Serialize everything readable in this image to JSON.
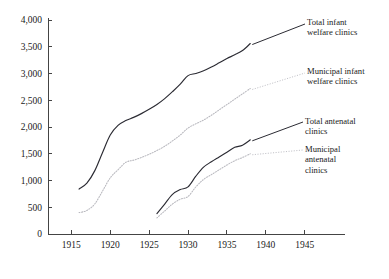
{
  "chart_data": {
    "type": "line",
    "title": "",
    "xlabel": "",
    "ylabel": "",
    "xlim": [
      1912,
      1948
    ],
    "ylim": [
      0,
      4000
    ],
    "grid": false,
    "legend_position": "right-annotations",
    "x_ticks": [
      "1915",
      "1920",
      "1925",
      "1930",
      "1935",
      "1940",
      "1945"
    ],
    "x_tick_values": [
      1915,
      1920,
      1925,
      1930,
      1935,
      1940,
      1945
    ],
    "y_ticks": [
      "0",
      "500",
      "1,000",
      "1,500",
      "2,000",
      "2,500",
      "3,000",
      "3,500",
      "4,000"
    ],
    "y_tick_values": [
      0,
      500,
      1000,
      1500,
      2000,
      2500,
      3000,
      3500,
      4000
    ],
    "series": [
      {
        "name": "Total infant welfare clinics",
        "style": "solid",
        "color": "#2b2b33",
        "x": [
          1916,
          1917,
          1918,
          1919,
          1920,
          1921,
          1922,
          1923,
          1924,
          1925,
          1926,
          1927,
          1928,
          1929,
          1930,
          1931,
          1932,
          1933,
          1934,
          1935,
          1936,
          1937,
          1938
        ],
        "values": [
          840,
          950,
          1180,
          1520,
          1850,
          2030,
          2120,
          2180,
          2250,
          2330,
          2420,
          2530,
          2660,
          2800,
          2960,
          3000,
          3050,
          3120,
          3200,
          3280,
          3350,
          3430,
          3560
        ]
      },
      {
        "name": "Municipal infant welfare clinics",
        "style": "dotted",
        "color": "#b9b9bf",
        "x": [
          1916,
          1917,
          1918,
          1919,
          1920,
          1921,
          1922,
          1923,
          1924,
          1925,
          1926,
          1927,
          1928,
          1929,
          1930,
          1931,
          1932,
          1933,
          1934,
          1935,
          1936,
          1937,
          1938
        ],
        "values": [
          400,
          440,
          560,
          800,
          1050,
          1200,
          1340,
          1380,
          1430,
          1490,
          1560,
          1640,
          1740,
          1850,
          1980,
          2060,
          2130,
          2220,
          2320,
          2420,
          2520,
          2620,
          2720
        ]
      },
      {
        "name": "Total antenatal clinics",
        "style": "solid",
        "color": "#2b2b33",
        "x": [
          1926,
          1927,
          1928,
          1929,
          1930,
          1931,
          1932,
          1933,
          1934,
          1935,
          1936,
          1937,
          1938
        ],
        "values": [
          380,
          560,
          740,
          830,
          880,
          1080,
          1250,
          1350,
          1440,
          1530,
          1620,
          1660,
          1760
        ]
      },
      {
        "name": "Municipal antenatal clinics",
        "style": "dotted",
        "color": "#b9b9bf",
        "x": [
          1926,
          1927,
          1928,
          1929,
          1930,
          1931,
          1932,
          1933,
          1934,
          1935,
          1936,
          1937,
          1938
        ],
        "values": [
          300,
          430,
          560,
          650,
          700,
          880,
          1020,
          1110,
          1200,
          1290,
          1370,
          1430,
          1500
        ]
      }
    ],
    "annotations": [
      {
        "id": "total-infant",
        "text": "Total infant\nwelfare clinics"
      },
      {
        "id": "muni-infant",
        "text": "Municipal infant\nwelfare clinics"
      },
      {
        "id": "total-antenatal",
        "text": "Total antenatal\nclinics"
      },
      {
        "id": "muni-antenatal",
        "text": "Municipal\nantenatal\nclinics"
      }
    ]
  }
}
